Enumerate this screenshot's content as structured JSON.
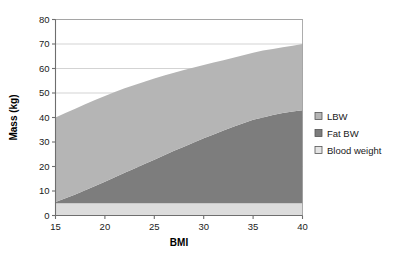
{
  "chart_data": {
    "type": "area",
    "title": "",
    "xlabel": "BMI",
    "ylabel": "Mass (kg)",
    "xlim": [
      15,
      40
    ],
    "ylim": [
      0,
      80
    ],
    "xticks": [
      15,
      20,
      25,
      30,
      35,
      40
    ],
    "yticks": [
      0,
      10,
      20,
      30,
      40,
      50,
      60,
      70,
      80
    ],
    "xtick_labels": [
      "15",
      "20",
      "25",
      "30",
      "35",
      "40"
    ],
    "ytick_labels": [
      "0",
      "10",
      "20",
      "30",
      "40",
      "50",
      "60",
      "70",
      "80"
    ],
    "grid": "horizontal",
    "legend_position": "right",
    "stacked": true,
    "stack_order_bottom_to_top": [
      "Blood weight",
      "Fat BW",
      "LBW"
    ],
    "x": [
      15,
      16,
      17,
      18,
      19,
      20,
      21,
      22,
      23,
      24,
      25,
      26,
      27,
      28,
      29,
      30,
      31,
      32,
      33,
      34,
      35,
      36,
      37,
      38,
      39,
      40
    ],
    "series": [
      {
        "name": "Blood weight",
        "color": "#dcdcdc",
        "values": [
          5,
          5,
          5,
          5,
          5,
          5,
          5,
          5,
          5,
          5,
          5,
          5,
          5,
          5,
          5,
          5,
          5,
          5,
          5,
          5,
          5,
          5,
          5,
          5,
          5,
          5
        ]
      },
      {
        "name": "Fat BW",
        "color": "#7d7d7d",
        "values": [
          0.5,
          2.0,
          3.6,
          5.3,
          7.0,
          8.8,
          10.6,
          12.4,
          14.2,
          16.0,
          17.8,
          19.6,
          21.4,
          23.1,
          24.8,
          26.5,
          28.1,
          29.7,
          31.2,
          32.7,
          34.1,
          35.0,
          36.0,
          36.8,
          37.5,
          38.0
        ]
      },
      {
        "name": "LBW",
        "color": "#b5b5b5",
        "values": [
          34.5,
          34.8,
          35.0,
          35.1,
          35.1,
          35.0,
          34.8,
          34.5,
          34.1,
          33.6,
          33.1,
          32.5,
          31.9,
          31.3,
          30.6,
          29.9,
          29.3,
          28.7,
          28.2,
          27.7,
          27.3,
          27.3,
          27.0,
          26.9,
          26.8,
          27.0
        ]
      }
    ],
    "stacked_totals": [
      40.0,
      41.8,
      43.6,
      45.4,
      47.1,
      48.8,
      50.4,
      51.9,
      53.3,
      54.6,
      55.9,
      57.1,
      58.3,
      59.4,
      60.4,
      61.4,
      62.4,
      63.4,
      64.4,
      65.4,
      66.4,
      67.3,
      68.0,
      68.7,
      69.3,
      70.0
    ],
    "fat_top_boundary": [
      5.5,
      7.0,
      8.6,
      10.3,
      12.0,
      13.8,
      15.6,
      17.4,
      19.2,
      21.0,
      22.8,
      24.6,
      26.4,
      28.1,
      29.8,
      31.5,
      33.1,
      34.7,
      36.2,
      37.7,
      39.1,
      40.0,
      41.0,
      41.8,
      42.5,
      43.0
    ]
  },
  "legend": {
    "items": [
      {
        "label": "LBW",
        "color": "#b5b5b5"
      },
      {
        "label": "Fat BW",
        "color": "#7d7d7d"
      },
      {
        "label": "Blood weight",
        "color": "#e4e4e4"
      }
    ]
  }
}
